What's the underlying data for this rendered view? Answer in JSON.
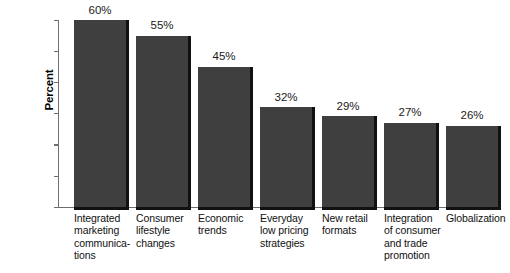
{
  "chart_data": {
    "type": "bar",
    "title": "",
    "xlabel": "",
    "ylabel": "Percent",
    "ylim": [
      0,
      60
    ],
    "yticks": [
      0,
      10,
      20,
      30,
      40,
      50,
      60
    ],
    "ytick_labels": [
      "0",
      "10",
      "20",
      "30",
      "40",
      "50",
      "60"
    ],
    "grid": false,
    "legend": "none",
    "orientation": "vertical",
    "bar_color": "#3f3f3f",
    "shadow_color": "#111111",
    "axis_color": "#6f6f6f",
    "categories": [
      "Integrated marketing communica-tions",
      "Consumer lifestyle changes",
      "Economic trends",
      "Everyday low pricing strategies",
      "New retail formats",
      "Integration of consumer and trade promotion",
      "Globalization"
    ],
    "category_label_lines": [
      [
        "Integrated",
        "marketing",
        "communica-",
        "tions"
      ],
      [
        "Consumer",
        "lifestyle",
        "changes"
      ],
      [
        "Economic",
        "trends"
      ],
      [
        "Everyday",
        "low pricing",
        "strategies"
      ],
      [
        "New retail",
        "formats"
      ],
      [
        "Integration",
        "of consumer",
        "and trade",
        "promotion"
      ],
      [
        "Globalization"
      ]
    ],
    "values": [
      60,
      55,
      45,
      32,
      29,
      27,
      26
    ],
    "value_labels": [
      "60%",
      "55%",
      "45%",
      "32%",
      "29%",
      "27%",
      "26%"
    ]
  }
}
